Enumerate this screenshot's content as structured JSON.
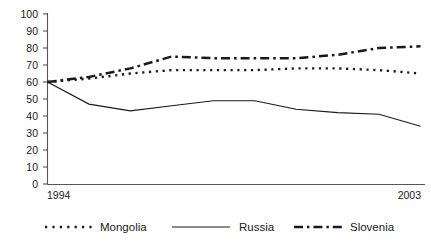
{
  "chart_data": {
    "type": "line",
    "title": "",
    "subtitle": "",
    "xlabel": "",
    "ylabel": "",
    "x": [
      1994,
      1995,
      1996,
      1997,
      1998,
      1999,
      2000,
      2001,
      2002,
      2003
    ],
    "xtick_labels": [
      "1994",
      "2003"
    ],
    "xtick_values": [
      1994,
      2003
    ],
    "xlim": [
      1994,
      2003
    ],
    "ylim": [
      0,
      100
    ],
    "ytick_labels": [
      "0",
      "10",
      "20",
      "30",
      "40",
      "50",
      "60",
      "70",
      "80",
      "90",
      "100"
    ],
    "ytick_values": [
      0,
      10,
      20,
      30,
      40,
      50,
      60,
      70,
      80,
      90,
      100
    ],
    "grid": false,
    "legend_position": "bottom",
    "series": [
      {
        "name": "Mongolia",
        "style": "dotted",
        "color": "#1a1a1a",
        "values": [
          60,
          62,
          65,
          67,
          67,
          67,
          68,
          68,
          67,
          65
        ]
      },
      {
        "name": "Russia",
        "style": "solid",
        "color": "#1a1a1a",
        "values": [
          60,
          47,
          43,
          46,
          49,
          49,
          44,
          42,
          41,
          34
        ]
      },
      {
        "name": "Slovenia",
        "style": "dash-dot",
        "color": "#1a1a1a",
        "values": [
          60,
          63,
          68,
          75,
          74,
          74,
          74,
          76,
          80,
          81
        ]
      }
    ]
  },
  "legend": {
    "items": [
      {
        "label": "Mongolia",
        "marker": "dotted-line-swatch"
      },
      {
        "label": "Russia",
        "marker": "solid-line-swatch"
      },
      {
        "label": "Slovenia",
        "marker": "dash-dot-line-swatch"
      }
    ]
  }
}
